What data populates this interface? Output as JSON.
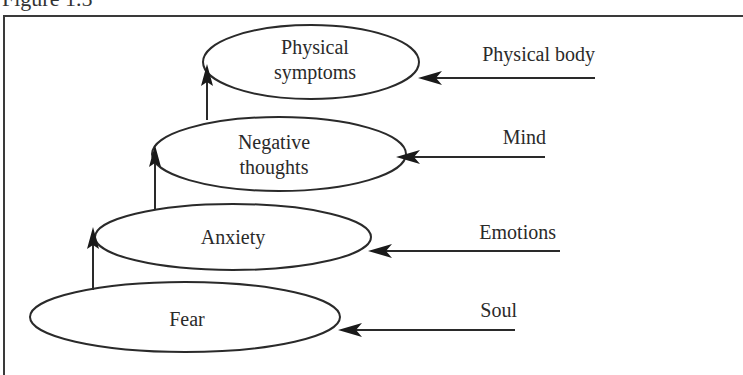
{
  "figure": {
    "caption": "Figure 1.5"
  },
  "nodes": [
    {
      "id": "fear",
      "line1": "Fear",
      "line2": ""
    },
    {
      "id": "anxiety",
      "line1": "Anxiety",
      "line2": ""
    },
    {
      "id": "negative_thoughts",
      "line1": "Negative",
      "line2": "thoughts"
    },
    {
      "id": "physical_symptoms",
      "line1": "Physical",
      "line2": "symptoms"
    }
  ],
  "levels": [
    {
      "label": "Soul",
      "points_to": "fear"
    },
    {
      "label": "Emotions",
      "points_to": "anxiety"
    },
    {
      "label": "Mind",
      "points_to": "negative_thoughts"
    },
    {
      "label": "Physical body",
      "points_to": "physical_symptoms"
    }
  ],
  "flow": [
    {
      "from": "fear",
      "to": "anxiety"
    },
    {
      "from": "anxiety",
      "to": "negative_thoughts"
    },
    {
      "from": "negative_thoughts",
      "to": "physical_symptoms"
    }
  ],
  "colors": {
    "stroke": "#2a2a2a",
    "background": "#ffffff"
  }
}
